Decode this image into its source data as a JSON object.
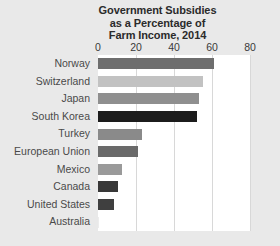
{
  "chart_data": {
    "type": "bar",
    "orientation": "horizontal",
    "title": "Government Subsidies as a Percentage of Farm Income, 2014",
    "title_lines": [
      "Government Subsidies",
      "as a Percentage of",
      "Farm Income, 2014"
    ],
    "xlabel": "",
    "ylabel": "",
    "xlim": [
      0,
      80
    ],
    "ylim": null,
    "xticks": [
      0,
      20,
      40,
      60,
      80
    ],
    "xtick_labels": [
      "0",
      "20",
      "40",
      "60",
      "80"
    ],
    "grid": true,
    "grid_axis": "x",
    "legend": false,
    "legend_position": "none",
    "axis_position": "top",
    "categories": [
      "Norway",
      "Switzerland",
      "Japan",
      "South Korea",
      "Turkey",
      "European Union",
      "Mexico",
      "Canada",
      "United States",
      "Australia"
    ],
    "values": [
      61,
      55,
      53,
      52,
      23,
      21,
      12.5,
      10.5,
      8.5,
      0.5
    ],
    "bar_colors": [
      "#6e6e6e",
      "#c2c2c2",
      "#8f8f8f",
      "#1c1c1c",
      "#8a8a8a",
      "#6a6a6a",
      "#9a9a9a",
      "#383838",
      "#3f3f3f",
      "#ededed"
    ],
    "background_color": "#e9e9e9",
    "plot_background_color": "#ffffff",
    "gridline_color": "#d8d8d8",
    "title_color": "#2b2b2b",
    "label_color": "#4a4a4a"
  }
}
